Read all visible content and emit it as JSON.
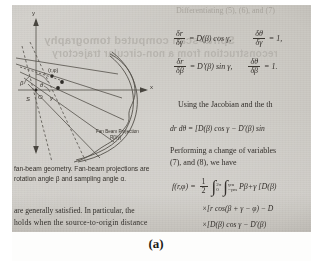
{
  "page": {
    "figure_label": "(a)",
    "cropped_header": "Differentiating (5), (6), and (7)"
  },
  "ghost_text": {
    "line1": "Spiral-scan computed tomography",
    "line2": "reconstruction from a non-circular trajectory"
  },
  "figure": {
    "axis_labels": {
      "y": "y",
      "x": "x"
    },
    "point_label": "(r,φ)",
    "angle_beta": "β",
    "angle_theta": "θ",
    "angle_gamma": "γ",
    "origin_label": "O",
    "source_label": "S",
    "distance_label": "D",
    "detector_caption_line1": "Fan Beam Projection",
    "detector_caption_line2": "Rβ(γ)"
  },
  "left_column": {
    "caption_line1": "fan-beam geometry. Fan-beam projections are",
    "caption_line2": "rotation angle β and sampling angle α.",
    "para_line1": "are generally satisfied. In particular, the",
    "para_line2": "holds when the source-to-origin distance"
  },
  "right_column": {
    "eq1": {
      "lhs_num": "δr",
      "lhs_den": "δγ",
      "rhs": "= D(β) cos γ,",
      "lhs2_num": "δθ",
      "lhs2_den": "δγ",
      "rhs2": "= 1,"
    },
    "eq2": {
      "lhs_num": "δr",
      "lhs_den": "δβ",
      "rhs": "= D'(β) sin γ,",
      "lhs2_num": "δθ",
      "lhs2_den": "δβ",
      "rhs2": "= 1."
    },
    "text1": "Using the Jacobian and the th",
    "eq3": "dr dθ = [D(β) cos γ − D'(β) sin",
    "text2_line1": "Performing a change of variables",
    "text2_line2": "(7), and (8), we have",
    "eq4": {
      "lhs": "f(r,φ) =",
      "frac_num": "1",
      "frac_den": "2",
      "int1_upper": "2π",
      "int1_lower": "0",
      "int2_upper": "γm",
      "int2_lower": "−γm",
      "tail": "Pβ+γ [D(β)"
    },
    "eq5": "×[r cos(β + γ − φ) − D",
    "eq6": "×[D(β) cos γ − D'(β)"
  }
}
